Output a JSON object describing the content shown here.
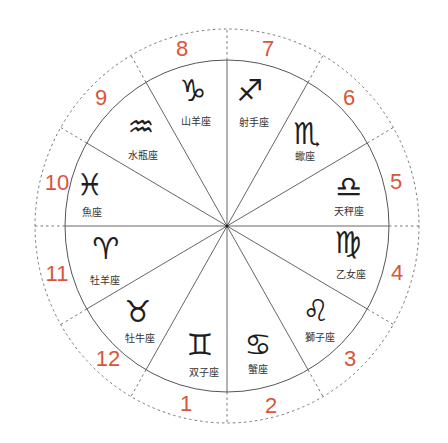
{
  "diagram": {
    "type": "zodiac-house-wheel",
    "center": [
      227,
      226
    ],
    "inner_radius": [
      162,
      166
    ],
    "outer_radius": [
      192,
      197
    ],
    "spoke_step_degrees": 30,
    "colors": {
      "accent": "#d9553a",
      "line": "#555555",
      "dashed": "#777777",
      "glyph": "#1e1e1e",
      "label": "#333333"
    },
    "segments": [
      {
        "house": "8",
        "sign": "capricorn",
        "glyph": "♑",
        "label": "山羊座",
        "glyph_pos": [
          193,
          90
        ],
        "label_pos": [
          196,
          121
        ],
        "num_pos": [
          182,
          48
        ]
      },
      {
        "house": "7",
        "sign": "sagittarius",
        "glyph": "♐",
        "label": "射手座",
        "glyph_pos": [
          250,
          90
        ],
        "label_pos": [
          254,
          122
        ],
        "num_pos": [
          268,
          48
        ],
        "moon": true
      },
      {
        "house": "6",
        "sign": "scorpio",
        "glyph": "♏",
        "label": "蠍座",
        "glyph_pos": [
          307,
          133
        ],
        "label_pos": [
          305,
          156
        ],
        "num_pos": [
          349,
          97
        ]
      },
      {
        "house": "5",
        "sign": "libra",
        "glyph": "♎",
        "label": "天秤座",
        "glyph_pos": [
          349,
          186
        ],
        "label_pos": [
          349,
          211
        ],
        "num_pos": [
          396,
          181
        ]
      },
      {
        "house": "4",
        "sign": "virgo",
        "glyph": "♍",
        "label": "乙女座",
        "glyph_pos": [
          348,
          242
        ],
        "label_pos": [
          351,
          274
        ],
        "num_pos": [
          397,
          272
        ]
      },
      {
        "house": "3",
        "sign": "leo",
        "glyph": "♌",
        "label": "獅子座",
        "glyph_pos": [
          316,
          310
        ],
        "label_pos": [
          320,
          337
        ],
        "num_pos": [
          350,
          358
        ]
      },
      {
        "house": "2",
        "sign": "cancer",
        "glyph": "♋",
        "label": "蟹座",
        "glyph_pos": [
          258,
          344
        ],
        "label_pos": [
          258,
          369
        ],
        "num_pos": [
          271,
          405
        ]
      },
      {
        "house": "1",
        "sign": "gemini",
        "glyph": "♊",
        "label": "双子座",
        "glyph_pos": [
          200,
          344
        ],
        "label_pos": [
          204,
          372
        ],
        "num_pos": [
          186,
          403
        ]
      },
      {
        "house": "12",
        "sign": "taurus",
        "glyph": "♉",
        "label": "牡牛座",
        "glyph_pos": [
          138,
          311
        ],
        "label_pos": [
          140,
          338
        ],
        "num_pos": [
          108,
          358
        ]
      },
      {
        "house": "11",
        "sign": "aries",
        "glyph": "♈",
        "label": "牡羊座",
        "glyph_pos": [
          106,
          248
        ],
        "label_pos": [
          105,
          280
        ],
        "num_pos": [
          57,
          273
        ]
      },
      {
        "house": "10",
        "sign": "pisces",
        "glyph": "♓",
        "label": "魚座",
        "glyph_pos": [
          90,
          184
        ],
        "label_pos": [
          92,
          212
        ],
        "num_pos": [
          57,
          182
        ]
      },
      {
        "house": "9",
        "sign": "aquarius",
        "glyph": "♒",
        "label": "水瓶座",
        "glyph_pos": [
          141,
          126
        ],
        "label_pos": [
          143,
          155
        ],
        "num_pos": [
          101,
          97
        ]
      }
    ],
    "moon": {
      "icon": "crescent-moon-icon",
      "pos": [
        244,
        157
      ]
    }
  }
}
